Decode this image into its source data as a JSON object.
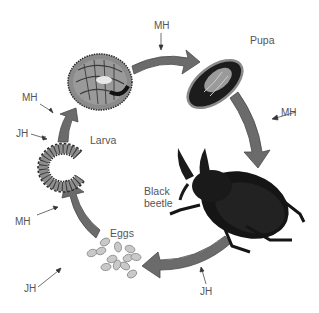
{
  "diagram": {
    "stages": {
      "pupa": "Pupa",
      "adult": "Black\nbeetle",
      "eggs": "Eggs",
      "larva": "Larva"
    },
    "hormone_labels": {
      "top": "MH",
      "right": "MH",
      "bottom": "JH",
      "eggs_to_larva_mh": "MH",
      "eggs_to_larva_jh": "JH",
      "larva_to_larva_mh": "MH",
      "larva_to_larva_jh": "JH"
    },
    "legend_terms": [
      "MH",
      "JH"
    ],
    "colors": {
      "arrow_fill": "#6b6b6b",
      "arrow_stroke": "#4a4a4a",
      "text": "#555555",
      "beetle": "#151515",
      "egg": "#c9c9c9"
    }
  }
}
